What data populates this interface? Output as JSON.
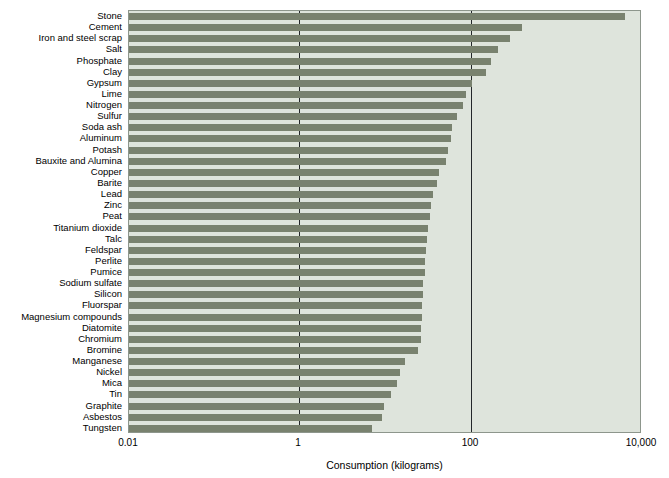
{
  "chart_data": {
    "type": "bar",
    "orientation": "horizontal",
    "title": "",
    "xlabel": "Consumption (kilograms)",
    "ylabel": "",
    "xscale": "log",
    "xlim": [
      0.01,
      10000
    ],
    "xticks": [
      "0.01",
      "1",
      "100",
      "10,000"
    ],
    "xtick_values": [
      0.01,
      1,
      100,
      10000
    ],
    "grid": "vertical gridlines at 1 and 100",
    "legend": "none",
    "plot_background": "#dee4dc",
    "bar_color": "#79826f",
    "categories": [
      "Stone",
      "Cement",
      "Iron and steel scrap",
      "Salt",
      "Phosphate",
      "Clay",
      "Gypsum",
      "Lime",
      "Nitrogen",
      "Sulfur",
      "Soda ash",
      "Aluminum",
      "Potash",
      "Bauxite and Alumina",
      "Copper",
      "Barite",
      "Lead",
      "Zinc",
      "Peat",
      "Titanium dioxide",
      "Talc",
      "Feldspar",
      "Perlite",
      "Pumice",
      "Sodium sulfate",
      "Silicon",
      "Fluorspar",
      "Magnesium compounds",
      "Diatomite",
      "Chromium",
      "Bromine",
      "Manganese",
      "Nickel",
      "Mica",
      "Tin",
      "Graphite",
      "Asbestos",
      "Tungsten"
    ],
    "values": [
      6500,
      380,
      290,
      220,
      190,
      170,
      110,
      88,
      79,
      63,
      50,
      47,
      42,
      40,
      30,
      28,
      24,
      22,
      21,
      19,
      18,
      17,
      16,
      16,
      15,
      15,
      14,
      14,
      13,
      13,
      11,
      8.0,
      6.5,
      5.8,
      4.2,
      3.0,
      2.7,
      1.8
    ],
    "value_unit": "kilograms",
    "bar_pixel_ends": [
      624,
      521,
      509,
      497,
      490,
      485,
      471,
      465,
      462,
      456,
      451,
      450,
      447,
      445,
      438,
      436,
      432,
      430,
      429,
      427,
      426,
      425,
      424,
      424,
      422,
      422,
      421,
      421,
      420,
      420,
      417,
      404,
      399,
      396,
      390,
      383,
      381,
      371
    ]
  },
  "axis": {
    "x_title": "Consumption (kilograms)",
    "ticks": [
      {
        "label": "0.01",
        "x": 128
      },
      {
        "label": "1",
        "x": 298
      },
      {
        "label": "100",
        "x": 470
      },
      {
        "label": "10,000",
        "x": 641
      }
    ],
    "gridlines_px": [
      298,
      470
    ]
  }
}
